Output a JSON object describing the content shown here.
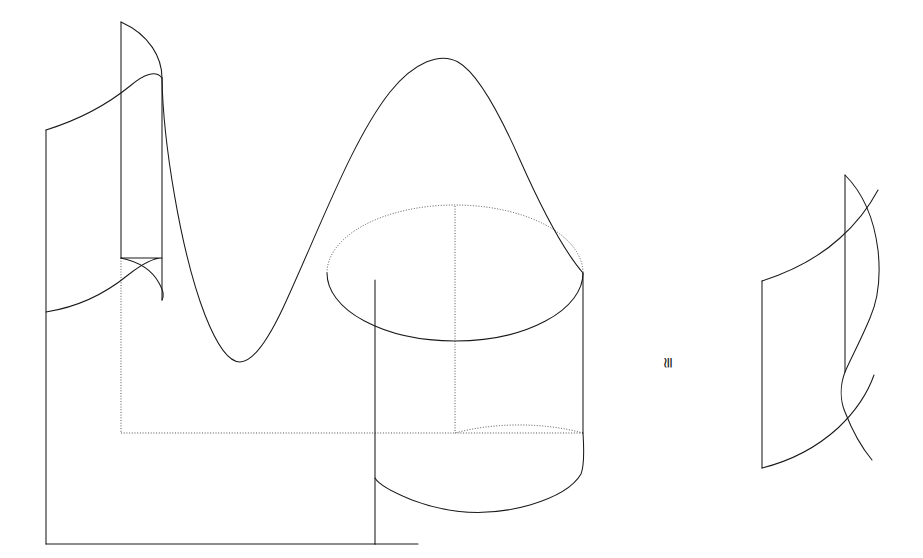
{
  "figure": {
    "background_color": "#ffffff",
    "line_color": "#1a1a1a",
    "hidden_line_color": "#4a4a4a",
    "canvas": {
      "width": 923,
      "height": 558
    },
    "relation_symbol": {
      "text": "≅",
      "name": "congruence-symbol",
      "rotation_degrees": -90,
      "x": 668,
      "y": 362
    },
    "left_object": {
      "name": "wavy-cut-cylinder",
      "description": "Cylinder whose top boundary is a sinusoidal curve; front vertical seam and hidden back seams drawn dotted",
      "bounds": {
        "x": 46,
        "y": 22,
        "width": 537,
        "height": 522
      },
      "parts": [
        {
          "name": "front-left-vertical-edge",
          "style": "solid",
          "x": 46,
          "y1": 130,
          "y2": 544
        },
        {
          "name": "inner-seam-vertical-edge",
          "style": "solid",
          "x": 162,
          "y1": 78,
          "y2": 300
        },
        {
          "name": "back-seam-vertical-edge",
          "style": "solid",
          "x": 121,
          "y1": 22,
          "y2": 260
        },
        {
          "name": "hidden-vertical-edge-left",
          "style": "dotted",
          "x": 121,
          "y1": 260,
          "y2": 433
        },
        {
          "name": "hidden-floor-edge",
          "style": "dotted",
          "x1": 121,
          "x2": 455,
          "y": 433
        },
        {
          "name": "front-vertical-seam",
          "style": "solid",
          "x": 375,
          "y1": 280,
          "y2": 544
        },
        {
          "name": "hidden-center-axis",
          "style": "dotted",
          "x": 455,
          "y1": 205,
          "y2": 433
        },
        {
          "name": "right-outer-edge",
          "style": "solid",
          "x": 583,
          "y1": 273,
          "y2": 470
        },
        {
          "name": "bottom-front-edge",
          "style": "solid",
          "x1": 46,
          "x2": 375,
          "y": 544
        }
      ]
    },
    "right_object": {
      "name": "fibre-ribbon-surface",
      "description": "Single curved ribbon (fibre) matching the left object's overhanging flap",
      "bounds": {
        "x": 762,
        "y": 175,
        "width": 120,
        "height": 295
      }
    },
    "ellipses": [
      {
        "name": "top-cut-ellipse",
        "cx": 455,
        "cy": 273,
        "rx": 128,
        "ry": 68,
        "upper_arc_style": "dotted",
        "lower_arc_style": "solid"
      },
      {
        "name": "bottom-base-ellipse",
        "cx": 455,
        "cy": 433,
        "rx": 128,
        "ry": 62,
        "upper_arc_style": "dotted",
        "lower_arc_style": "solid"
      }
    ],
    "curves": [
      {
        "name": "sinusoidal-top-boundary",
        "style": "solid",
        "peak": {
          "x": 458,
          "y": 62
        },
        "valley": {
          "x": 240,
          "y": 362
        },
        "left_end": {
          "x": 121,
          "y": 22
        },
        "right_end": {
          "x": 583,
          "y": 273
        }
      },
      {
        "name": "back-cut-curve",
        "style": "solid",
        "left_end": {
          "x": 46,
          "y": 130
        },
        "right_end": {
          "x": 162,
          "y": 78
        }
      }
    ]
  }
}
